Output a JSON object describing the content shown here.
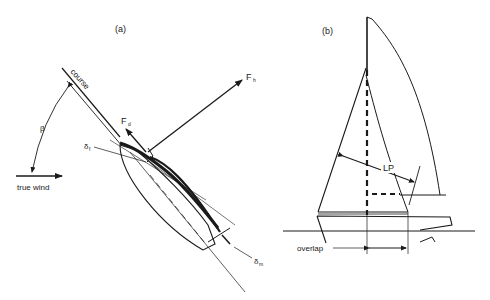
{
  "panel_a": {
    "label": "(a)",
    "course_label": "course",
    "beta_label": "β",
    "true_wind_label": "true wind",
    "fh_label": "F",
    "fh_sub": "h",
    "fd_label": "F",
    "fd_sub": "d",
    "delta_f_label": "δ",
    "delta_f_sub": "f",
    "delta_m_label": "δ",
    "delta_m_sub": "m"
  },
  "panel_b": {
    "label": "(b)",
    "lp_label": "LP",
    "overlap_label": "overlap"
  },
  "colors": {
    "ink": "#1a1a1a",
    "background": "#ffffff"
  }
}
